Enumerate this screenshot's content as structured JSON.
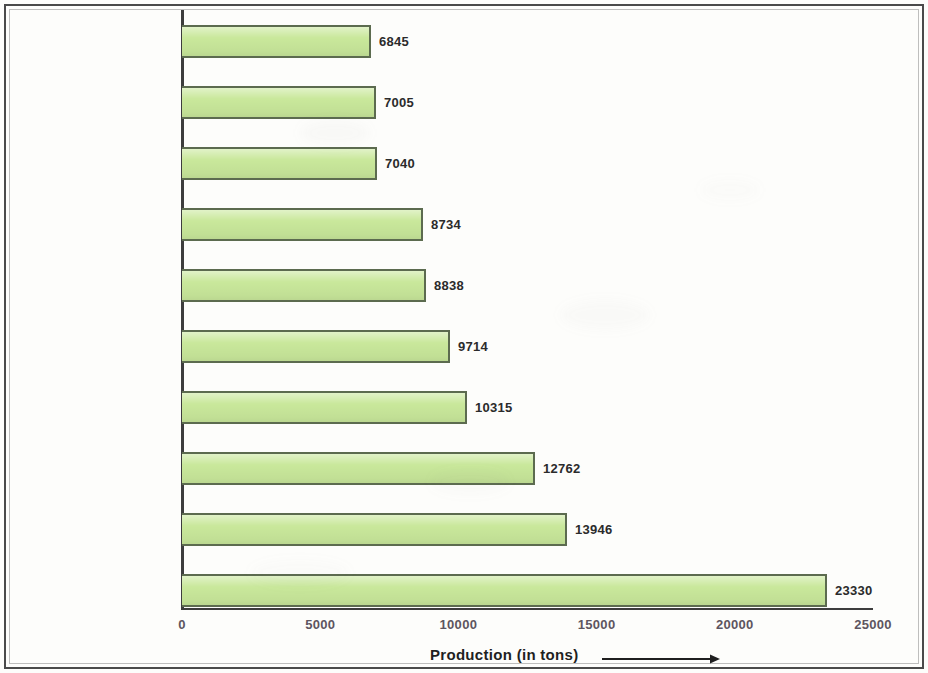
{
  "chart_data": {
    "type": "bar",
    "orientation": "horizontal",
    "title": "",
    "xlabel": "Production (in tons)",
    "ylabel": "",
    "xlim": [
      0,
      25000
    ],
    "xticks": [
      "0",
      "5000",
      "10000",
      "15000",
      "20000",
      "25000"
    ],
    "xtick_values": [
      0,
      5000,
      10000,
      15000,
      20000,
      25000
    ],
    "grid": false,
    "legend": false,
    "bar_color": "#c9e89b",
    "bar_border_color": "#5c6b4f",
    "categories": [
      "Bihar",
      "Tamil Nadu",
      "Haryana",
      "Maharashtra",
      "Madhya Pradesh",
      "Punjab",
      "Gujarat",
      "Andhra Pradesh",
      "Rajasthan",
      "Uttar Pradesh"
    ],
    "values": [
      6845,
      7005,
      7040,
      8734,
      8838,
      9714,
      10315,
      12762,
      13946,
      23330
    ],
    "value_labels": [
      "6845",
      "7005",
      "7040",
      "8734",
      "8838",
      "9714",
      "10315",
      "12762",
      "13946",
      "23330"
    ]
  },
  "axis": {
    "x_title": "Production (in tons)",
    "arrow_icon": "right-arrow-icon"
  }
}
